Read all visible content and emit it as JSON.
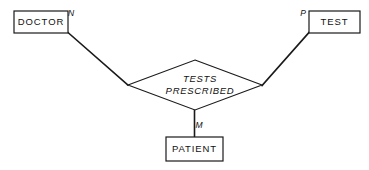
{
  "diagram": {
    "type": "entity-relationship-diagram",
    "title": "",
    "background_color": "#ffffff",
    "line_color": "#1a1a1a",
    "entities": [
      {
        "id": "doctor",
        "label": "DOCTOR",
        "shape": "rectangle",
        "x": 14,
        "y": 11,
        "width": 54,
        "height": 22
      },
      {
        "id": "test",
        "label": "TEST",
        "shape": "rectangle",
        "x": 309,
        "y": 11,
        "width": 51,
        "height": 22
      },
      {
        "id": "patient",
        "label": "PATIENT",
        "shape": "rectangle",
        "x": 166,
        "y": 137,
        "width": 57,
        "height": 24
      }
    ],
    "relationship": {
      "id": "tests-prescribed",
      "shape": "diamond",
      "label_line1": "TESTS",
      "label_line2": "PRESCRIBED",
      "center_x": 195,
      "center_y": 85,
      "half_width": 67,
      "half_height": 25
    },
    "connectors": [
      {
        "id": "doctor-to-relationship",
        "from": "doctor",
        "to": "tests-prescribed",
        "cardinality": "N"
      },
      {
        "id": "test-to-relationship",
        "from": "test",
        "to": "tests-prescribed",
        "cardinality": "P"
      },
      {
        "id": "patient-to-relationship",
        "from": "patient",
        "to": "tests-prescribed",
        "cardinality": "M"
      }
    ],
    "cardinality_labels": [
      {
        "id": "card-n",
        "text": "N",
        "x": 71,
        "y": 14
      },
      {
        "id": "card-p",
        "text": "P",
        "x": 303,
        "y": 14
      },
      {
        "id": "card-m",
        "text": "M",
        "x": 199,
        "y": 126
      }
    ]
  }
}
